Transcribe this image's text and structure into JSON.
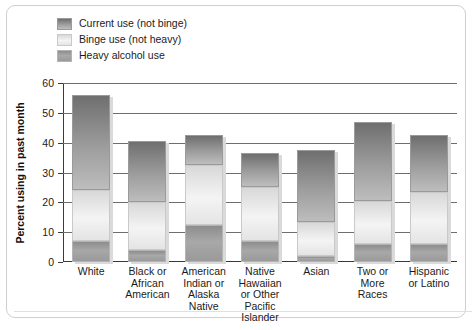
{
  "chart_data": {
    "type": "bar",
    "subtype": "stacked-bar",
    "title": "",
    "xlabel": "",
    "ylabel": "Percent using in past month",
    "ylim": [
      0,
      60
    ],
    "ytick_values": [
      0,
      10,
      20,
      30,
      40,
      50,
      60
    ],
    "ytick_labels": [
      "0",
      "10",
      "20",
      "30",
      "40",
      "50",
      "60"
    ],
    "grid": true,
    "legend_position": "top-left",
    "categories": [
      "White",
      "Black or African American",
      "American Indian or Alaska Native",
      "Native Hawaiian or Other Pacific Islander",
      "Asian",
      "Two or More Races",
      "Hispanic or Latino"
    ],
    "category_label_lines": [
      [
        "White"
      ],
      [
        "Black or",
        "African",
        "American"
      ],
      [
        "American",
        "Indian or",
        "Alaska",
        "Native"
      ],
      [
        "Native",
        "Hawaiian",
        "or Other",
        "Pacific",
        "Islander"
      ],
      [
        "Asian"
      ],
      [
        "Two or",
        "More",
        "Races"
      ],
      [
        "Hispanic",
        "or Latino"
      ]
    ],
    "series": [
      {
        "name": "Heavy alcohol use",
        "key": "heavy",
        "color": "#9a9a9a",
        "values": [
          7,
          4,
          12.5,
          7,
          2,
          6,
          6
        ]
      },
      {
        "name": "Binge use (not heavy)",
        "key": "binge",
        "color": "#e8e8e8",
        "values": [
          17,
          16,
          20,
          18,
          11.5,
          14.5,
          17.5
        ]
      },
      {
        "name": "Current use (not binge)",
        "key": "current",
        "color": "#8a8a8a",
        "values": [
          32,
          20.5,
          10,
          11.5,
          24,
          26.5,
          19
        ]
      }
    ],
    "stack_totals": [
      56,
      40.5,
      42.5,
      36.5,
      37.5,
      47,
      42.5
    ],
    "segment_tops": {
      "heavy": [
        7,
        4,
        12.5,
        7,
        2,
        6,
        6
      ],
      "binge": [
        24,
        20,
        32.5,
        25,
        13.5,
        20.5,
        23.5
      ],
      "current": [
        56,
        40.5,
        42.5,
        36.5,
        37.5,
        47,
        42.5
      ]
    }
  },
  "legend": {
    "items": [
      {
        "label": "Current use (not binge)",
        "key": "current"
      },
      {
        "label": "Binge use (not heavy)",
        "key": "binge"
      },
      {
        "label": "Heavy alcohol use",
        "key": "heavy"
      }
    ]
  },
  "axis": {
    "y_title": "Percent using in past month",
    "y_ticks": [
      "60",
      "50",
      "40",
      "30",
      "20",
      "10",
      "0"
    ]
  }
}
